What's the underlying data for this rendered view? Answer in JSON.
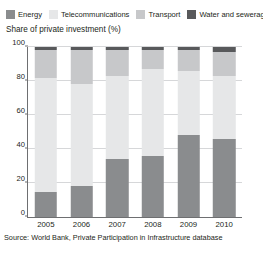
{
  "chart_data": {
    "type": "bar",
    "subtype": "stacked-100-percent",
    "title": "",
    "axis_title": "Share of private investment (%)",
    "xlabel": "",
    "ylabel": "",
    "categories": [
      "2005",
      "2006",
      "2007",
      "2008",
      "2009",
      "2010"
    ],
    "ylim": [
      0,
      100
    ],
    "yticks": [
      0,
      20,
      40,
      60,
      80,
      100
    ],
    "grid": true,
    "legend_position": "top",
    "series": [
      {
        "name": "Energy",
        "color": "#8a8c8e",
        "values": [
          15,
          18,
          34,
          36,
          48,
          46
        ]
      },
      {
        "name": "Telecommunications",
        "color": "#e6e7e8",
        "values": [
          67,
          60,
          49,
          51,
          38,
          37
        ]
      },
      {
        "name": "Transport",
        "color": "#c7c8ca",
        "values": [
          16,
          20,
          15,
          11,
          12,
          14
        ]
      },
      {
        "name": "Water and sewerage",
        "color": "#58595b",
        "values": [
          2,
          2,
          2,
          2,
          2,
          3
        ]
      }
    ],
    "source": "Source: World Bank, Private Participation in Infrastructure database"
  },
  "legend": {
    "items": [
      {
        "label": "Energy",
        "color": "#8a8c8e"
      },
      {
        "label": "Telecommunications",
        "color": "#e6e7e8"
      },
      {
        "label": "Transport",
        "color": "#c7c8ca"
      },
      {
        "label": "Water and sewerage",
        "color": "#58595b"
      }
    ]
  },
  "colors": {
    "axis": "#6e6f71",
    "grid": "#d6d7d9",
    "text": "#231f20",
    "background": "#ffffff"
  }
}
